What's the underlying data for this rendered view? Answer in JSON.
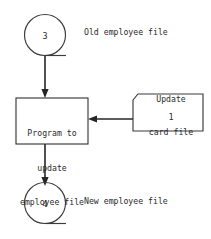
{
  "diagram": {
    "type": "data-processing-flowchart",
    "colors": {
      "background": "#ffffff",
      "stroke": "#3a3a3a",
      "connector": "#262626",
      "text": "#2b2b2b"
    },
    "nodes": {
      "tape_top": {
        "symbol": "magnetic-tape",
        "value": "3",
        "label": "Old employee file"
      },
      "process": {
        "symbol": "process",
        "lines": [
          "Program to",
          "update",
          "employee file"
        ]
      },
      "card": {
        "symbol": "punched-card",
        "value": "1",
        "caption_lines": [
          "Update",
          "card file"
        ]
      },
      "tape_bottom": {
        "symbol": "magnetic-tape",
        "value": "4",
        "label": "New employee file"
      }
    },
    "connectors": [
      {
        "name": "tape-top-to-process",
        "direction": "down"
      },
      {
        "name": "card-to-process",
        "direction": "left"
      },
      {
        "name": "process-to-tape-bottom",
        "direction": "down"
      }
    ]
  }
}
